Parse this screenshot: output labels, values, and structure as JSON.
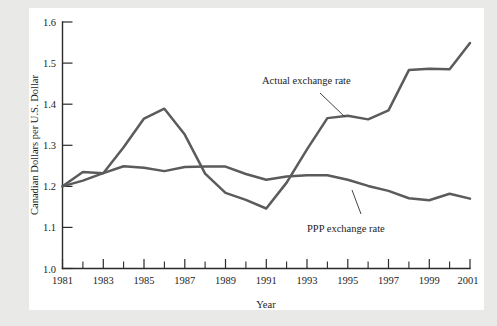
{
  "chart_data": {
    "type": "line",
    "title": "",
    "xlabel": "Year",
    "ylabel": "Canadian Dollars per U.S. Dollar",
    "xlim": [
      1981,
      2001
    ],
    "ylim": [
      1.0,
      1.6
    ],
    "grid": false,
    "legend_position": "inline-annotations",
    "x": [
      1981,
      1982,
      1983,
      1984,
      1985,
      1986,
      1987,
      1988,
      1989,
      1990,
      1991,
      1992,
      1993,
      1994,
      1995,
      1996,
      1997,
      1998,
      1999,
      2000,
      2001
    ],
    "x_tick_labels": [
      "1981",
      "1983",
      "1985",
      "1987",
      "1989",
      "1991",
      "1993",
      "1995",
      "1997",
      "1999",
      "2001"
    ],
    "y_tick_labels": [
      "1.0",
      "1.1",
      "1.2",
      "1.3",
      "1.4",
      "1.5",
      "1.6"
    ],
    "y_ticks": [
      1.0,
      1.1,
      1.2,
      1.3,
      1.4,
      1.5,
      1.6
    ],
    "series": [
      {
        "name": "Actual exchange rate",
        "color": "#5b5b5b",
        "values": [
          1.2,
          1.235,
          1.232,
          1.295,
          1.365,
          1.389,
          1.326,
          1.231,
          1.184,
          1.167,
          1.146,
          1.209,
          1.29,
          1.366,
          1.372,
          1.363,
          1.385,
          1.483,
          1.486,
          1.485,
          1.549
        ]
      },
      {
        "name": "PPP exchange rate",
        "color": "#5b5b5b",
        "values": [
          1.2,
          1.214,
          1.232,
          1.249,
          1.245,
          1.237,
          1.247,
          1.248,
          1.248,
          1.23,
          1.216,
          1.224,
          1.227,
          1.227,
          1.216,
          1.201,
          1.189,
          1.171,
          1.166,
          1.182,
          1.17
        ]
      }
    ],
    "annotations": [
      {
        "text": "Actual exchange rate",
        "anchor_year": 1994,
        "anchor_value": 1.366
      },
      {
        "text": "PPP exchange rate",
        "anchor_year": 1997,
        "anchor_value": 1.189
      }
    ]
  }
}
